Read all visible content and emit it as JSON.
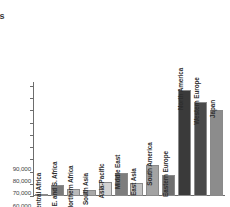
{
  "page": {
    "cut_text_lines": [
      "d",
      "rts"
    ]
  },
  "chart_data": {
    "type": "bar",
    "title": "",
    "subtitle": "",
    "xlabel": "",
    "ylabel": "",
    "ylim": [
      0,
      90000
    ],
    "ytick_values": [
      0,
      10000,
      20000,
      30000,
      40000,
      50000,
      60000,
      70000,
      80000,
      90000
    ],
    "ytick_labels": [
      "0",
      "10,000",
      "20,000",
      "30,000",
      "40,000",
      "50,000",
      "60,000",
      "70,000",
      "80,000",
      "90,000"
    ],
    "grid": false,
    "legend": null,
    "categories": [
      "Central Africa",
      "E. and S. Africa",
      "Northern Africa",
      "South Asia",
      "Asia-Pacific",
      "Middle East",
      "East Asia",
      "South America",
      "Eastern Europe",
      "North America",
      "Western Europe",
      "Japan"
    ],
    "values": [
      2000,
      9000,
      5500,
      5000,
      11500,
      19000,
      11000,
      25000,
      17000,
      87000,
      77000,
      70000
    ],
    "bar_colors": [
      "#8f8f8f",
      "#7a7a7a",
      "#b9b9b9",
      "#a8a8a8",
      "#d2d2d2",
      "#7d7d7d",
      "#c2c2c2",
      "#a3a3a3",
      "#6f6f6f",
      "#3a3a3a",
      "#4a4a4a",
      "#8c8c8c"
    ],
    "axis_color": "#6d6d6d",
    "label_color": "#2e2e2e"
  }
}
